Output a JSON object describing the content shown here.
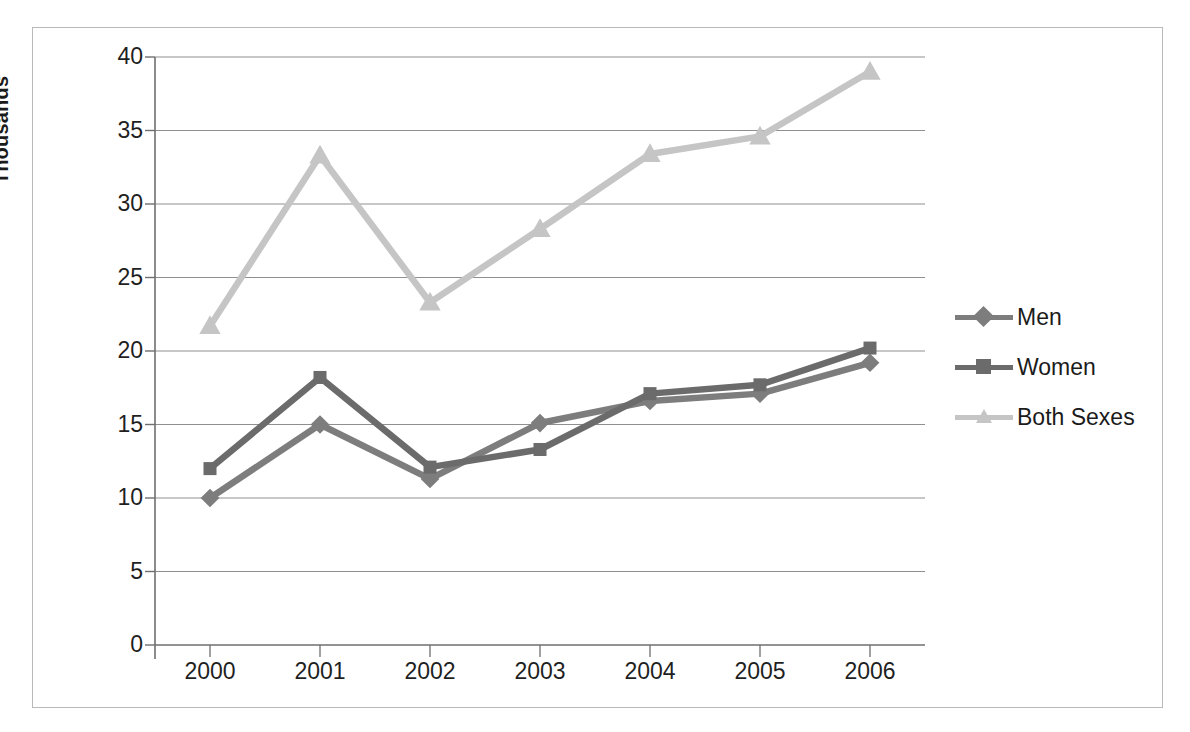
{
  "chart_data": {
    "type": "line",
    "title": "",
    "subtitle": "",
    "xlabel": "",
    "ylabel": "Thousands",
    "categories": [
      "2000",
      "2001",
      "2002",
      "2003",
      "2004",
      "2005",
      "2006"
    ],
    "ylim": [
      0,
      40
    ],
    "ytick_step": 5,
    "yticks": [
      "0",
      "5",
      "10",
      "15",
      "20",
      "25",
      "30",
      "35",
      "40"
    ],
    "grid": true,
    "grid_axis": "y",
    "legend_position": "right",
    "series": [
      {
        "name": "Men",
        "marker": "diamond",
        "color": "#7d7d7d",
        "values": [
          10.0,
          15.0,
          11.3,
          15.1,
          16.6,
          17.1,
          19.2
        ]
      },
      {
        "name": "Women",
        "marker": "square",
        "color": "#6b6b6b",
        "values": [
          12.0,
          18.2,
          12.1,
          13.3,
          17.1,
          17.7,
          20.2
        ]
      },
      {
        "name": "Both Sexes",
        "marker": "triangle",
        "color": "#c5c5c5",
        "values": [
          21.7,
          33.3,
          23.3,
          28.3,
          33.4,
          34.6,
          39.0
        ]
      }
    ]
  },
  "legend": {
    "items": [
      {
        "label": "Men"
      },
      {
        "label": "Women"
      },
      {
        "label": "Both Sexes"
      }
    ]
  },
  "axis": {
    "y_title": "Thousands"
  },
  "colors": {
    "men": "#7d7d7d",
    "women": "#6b6b6b",
    "both_sexes": "#c5c5c5",
    "gridline": "#8f8f8f",
    "axis": "#6f6f6f",
    "frame": "#b9b9b9",
    "text": "#1f1f1f"
  }
}
